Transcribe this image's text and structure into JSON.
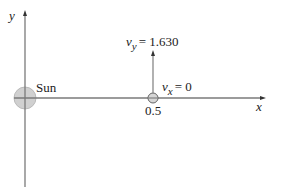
{
  "diagram": {
    "axes": {
      "x_label": "x",
      "y_label": "y"
    },
    "sun": {
      "label": "Sun",
      "fill": "#cfcfcf",
      "stroke": "#aaaaaa"
    },
    "planet": {
      "position_label": "0.5",
      "fill": "#d6d6d6",
      "stroke": "#555555"
    },
    "velocity": {
      "vy_symbol": "v",
      "vy_sub": "y",
      "vy_value": "= 1.630",
      "vx_symbol": "v",
      "vx_sub": "x",
      "vx_value": "= 0"
    },
    "colors": {
      "axis": "#777777",
      "text": "#222222"
    }
  }
}
